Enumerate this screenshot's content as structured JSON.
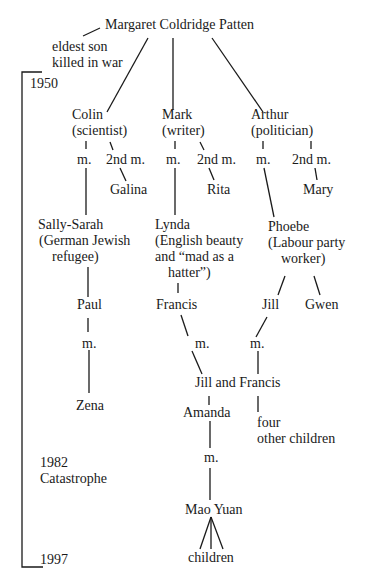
{
  "root": {
    "name": "Margaret Coldridge Patten"
  },
  "eldest_son_note": {
    "line1": "eldest son",
    "line2": "killed in war"
  },
  "timeline": {
    "start": "1950",
    "event_year": "1982",
    "event_label": "Catastrophe",
    "end": "1997"
  },
  "children": [
    {
      "name": "Colin",
      "role": "(scientist)",
      "marriage": "m.",
      "second_marriage": "2nd m.",
      "second_spouse": "Galina",
      "spouse": {
        "line1": "Sally-Sarah",
        "line2": "(German Jewish",
        "line3": "refugee)"
      }
    },
    {
      "name": "Mark",
      "role": "(writer)",
      "marriage": "m.",
      "second_marriage": "2nd m.",
      "second_spouse": "Rita",
      "spouse": {
        "line1": "Lynda",
        "line2": "(English beauty",
        "line3": "and “mad as a",
        "line4": "hatter”)"
      }
    },
    {
      "name": "Arthur",
      "role": "(politician)",
      "marriage": "m.",
      "second_marriage": "2nd m.",
      "second_spouse": "Mary",
      "spouse": {
        "line1": "Phoebe",
        "line2": "(Labour party",
        "line3": "worker)"
      }
    }
  ],
  "grandchildren": {
    "paul": "Paul",
    "paul_marriage": "m.",
    "zena": "Zena",
    "francis": "Francis",
    "francis_marriage": "m.",
    "jill": "Jill",
    "jill_marriage": "m.",
    "gwen": "Gwen",
    "couple": "Jill and Francis",
    "amanda": "Amanda",
    "amanda_marriage": "m.",
    "other_children_line1": "four",
    "other_children_line2": "other children",
    "mao_yuan": "Mao Yuan",
    "mao_children": "children"
  }
}
